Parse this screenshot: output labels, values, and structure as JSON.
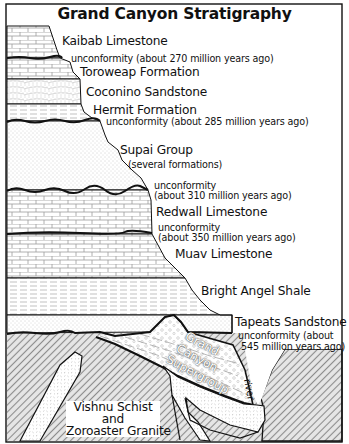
{
  "title": "Grand Canyon Stratigraphy",
  "layers": [
    {
      "name": "Kaibab Limestone",
      "pattern": "limestone"
    },
    {
      "name": "Toroweap Formation",
      "pattern": "limestone"
    },
    {
      "name": "Coconino Sandstone",
      "pattern": "sandstone"
    },
    {
      "name": "Hermit Formation",
      "pattern": "shale"
    },
    {
      "name": "Supai Group",
      "note": "(several formations)",
      "pattern": "sandstone"
    },
    {
      "name": "Redwall Limestone",
      "pattern": "limestone"
    },
    {
      "name": "Muav Limestone",
      "pattern": "limestone"
    },
    {
      "name": "Bright Angel Shale",
      "pattern": "shale"
    },
    {
      "name": "Tapeats Sandstone",
      "pattern": "sandstone"
    }
  ],
  "unconformities": [
    {
      "text": "unconformity (about 270 million years ago)"
    },
    {
      "text": "unconformity (about 285 million years ago)"
    },
    {
      "line1": "unconformity",
      "line2": "(about 310 million years ago)"
    },
    {
      "line1": "unconformity",
      "line2": "(about 350 million years ago)"
    },
    {
      "line1": "unconformity (about",
      "line2": "545 million years ago)"
    }
  ],
  "supergroup": {
    "line1": "Grand",
    "line2": "Canyon",
    "line3": "Supergroup"
  },
  "basement": {
    "line1": "Vishnu Schist",
    "line2": "and",
    "line3": "Zoroaster Granite"
  },
  "river_label": "river",
  "colors": {
    "line": "#111111",
    "background": "#ffffff",
    "pattern": "#9a9a9a",
    "hatch": "#8c8c8c"
  }
}
